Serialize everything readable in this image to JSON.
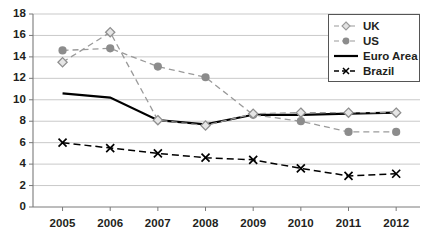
{
  "chart_data": {
    "type": "line",
    "title": "",
    "xlabel": "",
    "ylabel": "",
    "categories": [
      "2005",
      "2006",
      "2007",
      "2008",
      "2009",
      "2010",
      "2011",
      "2012"
    ],
    "x": [
      2005,
      2006,
      2007,
      2008,
      2009,
      2010,
      2011,
      2012
    ],
    "ylim": [
      0,
      18
    ],
    "ytick_values": [
      0,
      2,
      4,
      6,
      8,
      10,
      12,
      14,
      16,
      18
    ],
    "ytick_labels": [
      "0",
      "2",
      "4",
      "6",
      "8",
      "10",
      "12",
      "14",
      "16",
      "18"
    ],
    "grid": "horizontal",
    "legend_position": "top-right",
    "series": [
      {
        "name": "UK",
        "values": [
          13.5,
          16.3,
          8.1,
          7.6,
          8.7,
          8.8,
          8.8,
          8.8
        ],
        "color": "#9a9a9a",
        "line_style": "dashed",
        "marker": "diamond-open"
      },
      {
        "name": "US",
        "values": [
          14.6,
          14.8,
          13.1,
          12.1,
          8.6,
          8.0,
          7.0,
          7.0
        ],
        "color": "#9a9a9a",
        "line_style": "dashed",
        "marker": "circle-filled"
      },
      {
        "name": "Euro Area",
        "values": [
          10.6,
          10.2,
          8.1,
          7.7,
          8.6,
          8.6,
          8.7,
          8.8
        ],
        "color": "#000000",
        "line_style": "solid",
        "marker": "none"
      },
      {
        "name": "Brazil",
        "values": [
          6.0,
          5.5,
          5.0,
          4.6,
          4.4,
          3.6,
          2.9,
          3.1
        ],
        "color": "#000000",
        "line_style": "dashed",
        "marker": "x"
      }
    ]
  },
  "legend": {
    "items": [
      {
        "label": "UK"
      },
      {
        "label": "US"
      },
      {
        "label": "Euro Area"
      },
      {
        "label": "Brazil"
      }
    ]
  }
}
